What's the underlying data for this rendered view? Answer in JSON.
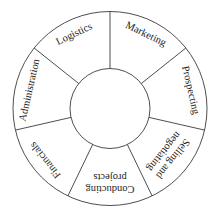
{
  "diagram": {
    "type": "ring",
    "center": [
      110,
      108.5
    ],
    "outer_radius": 97,
    "inner_radius": 40,
    "start_angle_deg": 0,
    "stroke_color": "#3a3a3a",
    "text_color": "#1e1e1e",
    "center_label": "",
    "segments": [
      {
        "lines": [
          "Marketing"
        ]
      },
      {
        "lines": [
          "Prospecting"
        ]
      },
      {
        "lines": [
          "Selling and",
          "negotiating"
        ]
      },
      {
        "lines": [
          "Conducting",
          "projects"
        ]
      },
      {
        "lines": [
          "Financials"
        ]
      },
      {
        "lines": [
          "Administration"
        ]
      },
      {
        "lines": [
          "Logistics"
        ]
      }
    ]
  }
}
